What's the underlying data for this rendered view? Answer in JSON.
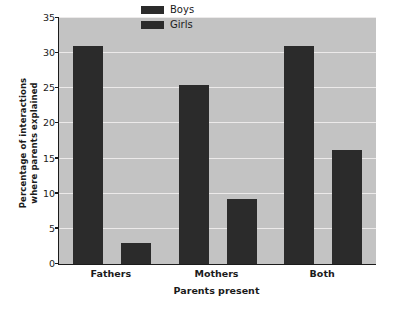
{
  "chart_data": {
    "type": "bar",
    "title": "",
    "xlabel": "Parents present",
    "ylabel_line1": "Percentage of interactions",
    "ylabel_line2": "where parents explained",
    "categories": [
      "Fathers",
      "Mothers",
      "Both"
    ],
    "series": [
      {
        "name": "Boys",
        "values": [
          31.0,
          25.5,
          31.0
        ],
        "color": "#2b2b2b"
      },
      {
        "name": "Girls",
        "values": [
          3.0,
          9.2,
          16.2
        ],
        "color": "#2b2b2b"
      }
    ],
    "ylim": [
      0,
      35
    ],
    "yticks": [
      0,
      5,
      10,
      15,
      20,
      25,
      30,
      35
    ],
    "ytick_labels": [
      "0",
      "5",
      "10",
      "15",
      "20",
      "25",
      "30",
      "35"
    ],
    "grid": true,
    "legend_position": "top-center",
    "plot_background": "#c3c3c3",
    "gridline_color": "#eceaea",
    "axis_color": "#1b1b1b",
    "figure_background": "#ffffff"
  }
}
